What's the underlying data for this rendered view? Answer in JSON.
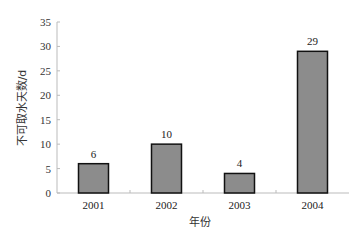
{
  "chart_data": {
    "type": "bar",
    "title": "",
    "xlabel": "年份",
    "ylabel": "不可取水天数/d",
    "categories": [
      "2001",
      "2002",
      "2003",
      "2004"
    ],
    "values": [
      6,
      10,
      4,
      29
    ],
    "data_labels": [
      "6",
      "10",
      "4",
      "29"
    ],
    "ylim": [
      0,
      35
    ],
    "yticks": [
      0,
      5,
      10,
      15,
      20,
      25,
      30,
      35
    ],
    "grid": false,
    "legend": null,
    "colors": {
      "bar_fill": "#8c8c8c",
      "bar_stroke": "#111111",
      "axis": "#bbbbbb"
    }
  }
}
